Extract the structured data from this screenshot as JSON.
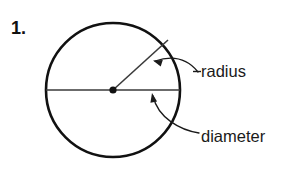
{
  "figure": {
    "item_number": "1.",
    "background_color": "#ffffff",
    "stroke_color": "#111111",
    "text_color": "#1a1a1a",
    "circle": {
      "center_x": 113,
      "center_y": 90,
      "radius": 67,
      "stroke_width": 2.6
    },
    "center_point": {
      "x": 113,
      "y": 90,
      "dot_radius": 3.6
    },
    "diameter_line": {
      "x1": 46,
      "y1": 90,
      "x2": 180,
      "y2": 90,
      "stroke_width": 1.6
    },
    "radius_line": {
      "x1": 113,
      "y1": 90,
      "x2": 168,
      "y2": 40,
      "stroke_width": 1.6
    },
    "labels": {
      "radius": "radius",
      "diameter": "diameter"
    },
    "leaders": [
      {
        "name": "radius-leader",
        "path": "M 198 72 C 186 57 170 56 155 61",
        "arrow_x": 153,
        "arrow_y": 60.5,
        "arrow_angle": -162
      },
      {
        "name": "diameter-leader",
        "path": "M 199 133 C 180 130 158 118 153 96",
        "arrow_x": 152,
        "arrow_y": 93,
        "arrow_angle": -101
      }
    ]
  }
}
